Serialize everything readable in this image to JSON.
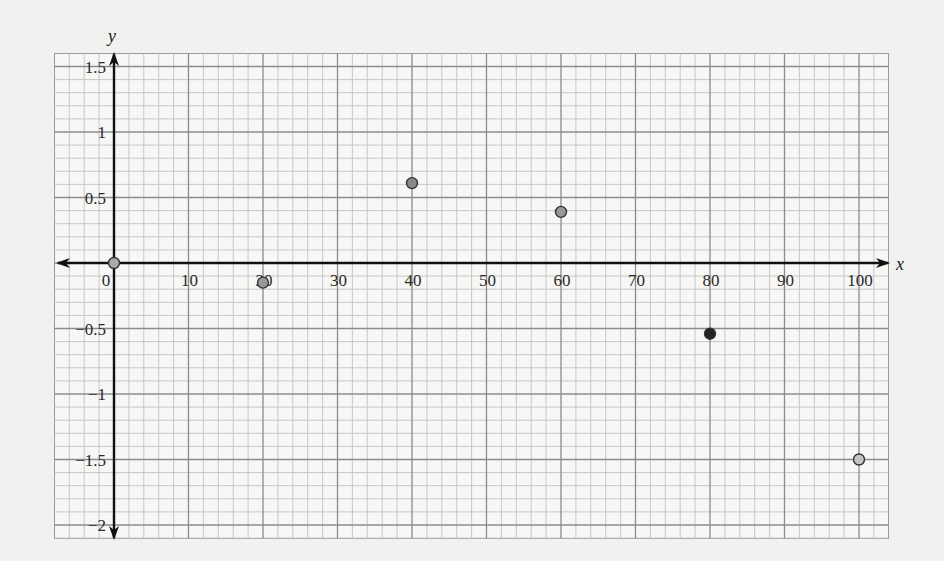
{
  "chart_data": {
    "type": "scatter",
    "title": "",
    "xlabel": "x",
    "ylabel": "y",
    "xlim": [
      -8,
      104
    ],
    "ylim": [
      -2.1,
      1.6
    ],
    "grid": true,
    "legend": null,
    "x_ticks": [
      0,
      10,
      20,
      30,
      40,
      50,
      60,
      70,
      80,
      90,
      100
    ],
    "x_tick_labels": [
      "0",
      "10",
      "20",
      "30",
      "40",
      "50",
      "60",
      "70",
      "80",
      "90",
      "100"
    ],
    "y_ticks": [
      1.5,
      1,
      0.5,
      -0.5,
      -1,
      -1.5,
      -2
    ],
    "y_tick_labels": [
      "1.5",
      "1",
      "0.5",
      "−0.5",
      "−1",
      "−1.5",
      "−2"
    ],
    "points": [
      {
        "x": 0,
        "y": 0,
        "color": "#aaaaaa"
      },
      {
        "x": 20,
        "y": -0.15,
        "color": "#999999"
      },
      {
        "x": 40,
        "y": 0.61,
        "color": "#8a8a8a"
      },
      {
        "x": 60,
        "y": 0.39,
        "color": "#999999"
      },
      {
        "x": 80,
        "y": -0.54,
        "color": "#222222"
      },
      {
        "x": 100,
        "y": -1.5,
        "color": "#c4c4c4"
      }
    ]
  }
}
